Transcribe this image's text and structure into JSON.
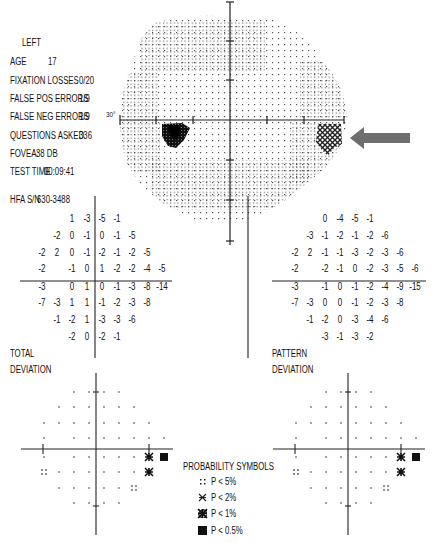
{
  "header": {
    "eye": "LEFT",
    "fields": [
      {
        "label": "AGE",
        "value": "17"
      },
      {
        "label": "FIXATION LOSSES",
        "value": "0/20"
      },
      {
        "label": "FALSE POS ERRORS",
        "value": "1/9"
      },
      {
        "label": "FALSE NEG ERRORS",
        "value": "1/9"
      },
      {
        "label": "QUESTIONS ASKED",
        "value": "336"
      },
      {
        "label": "FOVEA:",
        "value": "38 DB"
      },
      {
        "label": "TEST TIME",
        "value": "00:09:41"
      }
    ],
    "serial_label": "HFA S/N",
    "serial_value": "630-3488"
  },
  "grayscale_plot": {
    "axis_label": "30°",
    "arrow_color": "#6e6e6e",
    "defect_locations": [
      "left-inferior blind spot",
      "right-nasal step (arrow)"
    ]
  },
  "total_deviation": {
    "title_line1": "TOTAL",
    "title_line2": "DEVIATION",
    "rows": [
      [
        "",
        "",
        "1",
        "-3",
        "-5",
        "-1",
        "",
        "",
        "",
        ""
      ],
      [
        "",
        "-2",
        "0",
        "-1",
        "0",
        "-1",
        "-5",
        "",
        "",
        ""
      ],
      [
        "-2",
        "2",
        "0",
        "-1",
        "-2",
        "-1",
        "-2",
        "-5",
        "",
        ""
      ],
      [
        "-2",
        "",
        "-1",
        "0",
        "1",
        "-2",
        "-2",
        "-4",
        "-5",
        ""
      ],
      [
        "-3",
        "",
        "0",
        "1",
        "0",
        "-1",
        "-3",
        "-8",
        "-14",
        ""
      ],
      [
        "-7",
        "-3",
        "1",
        "1",
        "-1",
        "-2",
        "-3",
        "-8",
        "",
        ""
      ],
      [
        "",
        "-1",
        "-2",
        "1",
        "-3",
        "-3",
        "-6",
        "",
        "",
        ""
      ],
      [
        "",
        "",
        "-2",
        "0",
        "-2",
        "-1",
        "",
        "",
        "",
        ""
      ]
    ]
  },
  "pattern_deviation": {
    "title_line1": "PATTERN",
    "title_line2": "DEVIATION",
    "rows": [
      [
        "",
        "",
        "0",
        "-4",
        "-5",
        "-1",
        "",
        "",
        "",
        ""
      ],
      [
        "",
        "-3",
        "-1",
        "-2",
        "-1",
        "-2",
        "-6",
        "",
        "",
        ""
      ],
      [
        "-2",
        "2",
        "-1",
        "-1",
        "-3",
        "-2",
        "-3",
        "-6",
        "",
        ""
      ],
      [
        "-2",
        "",
        "-2",
        "-1",
        "0",
        "-2",
        "-3",
        "-5",
        "-6",
        ""
      ],
      [
        "-3",
        "",
        "-1",
        "0",
        "-1",
        "-2",
        "-4",
        "-9",
        "-15",
        ""
      ],
      [
        "-7",
        "-3",
        "0",
        "0",
        "-1",
        "-2",
        "-3",
        "-8",
        "",
        ""
      ],
      [
        "",
        "-1",
        "-2",
        "0",
        "-3",
        "-4",
        "-6",
        "",
        "",
        ""
      ],
      [
        "",
        "",
        "-3",
        "-1",
        "-3",
        "-2",
        "",
        "",
        "",
        ""
      ]
    ]
  },
  "probability_legend": {
    "title": "PROBABILITY SYMBOLS",
    "items": [
      {
        "symbol": "p5-icon",
        "text": "P < 5%"
      },
      {
        "symbol": "p2-icon",
        "text": "P < 2%"
      },
      {
        "symbol": "p1-icon",
        "text": "P < 1%"
      },
      {
        "symbol": "p05-icon",
        "text": "P < 0.5%"
      }
    ]
  }
}
